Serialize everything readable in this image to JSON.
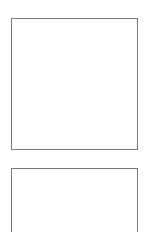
{
  "panels": [
    {
      "id": "panel-1",
      "label": "",
      "border_color": "#7a7a7a"
    },
    {
      "id": "panel-2",
      "label": "",
      "border_color": "#7a7a7a"
    }
  ],
  "colors": {
    "background": "#ffffff",
    "border": "#7a7a7a"
  }
}
